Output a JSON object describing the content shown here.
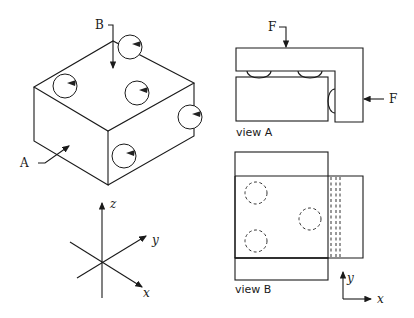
{
  "figure": {
    "isometric": {
      "label_top_arrow": "B",
      "label_side_arrow": "A",
      "ball_count": 5
    },
    "axes3d": {
      "x": "x",
      "y": "y",
      "z": "z"
    },
    "view_a": {
      "caption": "view A",
      "force_top": "F",
      "force_side": "F"
    },
    "view_b": {
      "caption": "view B",
      "axis_x": "x",
      "axis_y": "y"
    }
  },
  "colors": {
    "line": "#1a1a1a",
    "background": "#ffffff"
  }
}
